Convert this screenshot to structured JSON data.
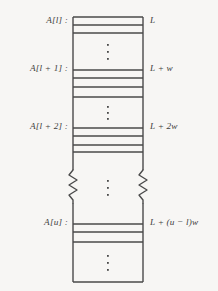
{
  "figure": {
    "background_color": "#f7f6f4",
    "line_color": "#4a4a4a",
    "text_color": "#3d3d3d",
    "box": {
      "left": 73,
      "right": 143,
      "top": 17,
      "bottom": 282
    },
    "left_labels": [
      {
        "id": "a-l",
        "text": "A[l] :",
        "y": 21
      },
      {
        "id": "a-l-plus-1",
        "text": "A[l + 1] :",
        "y": 69
      },
      {
        "id": "a-l-plus-2",
        "text": "A[l + 2] :",
        "y": 127
      },
      {
        "id": "a-u",
        "text": "A[u] :",
        "y": 223
      }
    ],
    "right_labels": [
      {
        "id": "addr-L",
        "text": "L",
        "y": 21
      },
      {
        "id": "addr-L-w",
        "text": "L + w",
        "y": 69
      },
      {
        "id": "addr-L-2w",
        "text": "L + 2w",
        "y": 127
      },
      {
        "id": "addr-L-u-l-w",
        "text": "L + (u − l)w",
        "y": 223
      }
    ],
    "cell_divider_rows": [
      25,
      33,
      70,
      78,
      87,
      97,
      128,
      136,
      145,
      152,
      224,
      232,
      242
    ],
    "vertical_ellipses": [
      {
        "id": "ellipsis-1",
        "cx": 108,
        "y_top": 43,
        "count": 3
      },
      {
        "id": "ellipsis-2",
        "cx": 108,
        "y_top": 107,
        "count": 3
      },
      {
        "id": "ellipsis-3",
        "cx": 108,
        "y_top": 181,
        "count": 3
      },
      {
        "id": "ellipsis-4",
        "cx": 108,
        "y_top": 255,
        "count": 3
      }
    ],
    "break_symbols": [
      {
        "id": "zigzag-left",
        "x": 73,
        "y_top": 170,
        "y_bottom": 203
      },
      {
        "id": "zigzag-right",
        "x": 143,
        "y_top": 170,
        "y_bottom": 203
      }
    ]
  }
}
